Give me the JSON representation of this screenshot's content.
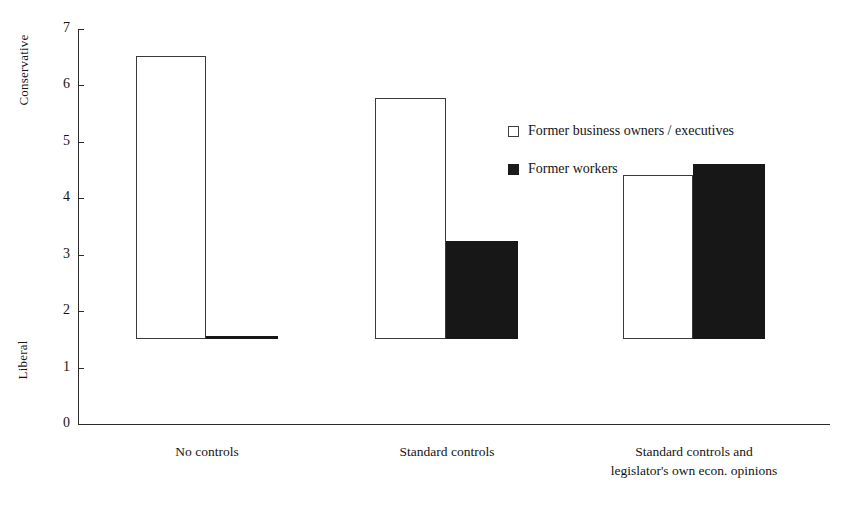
{
  "chart_data": {
    "type": "bar",
    "title": "",
    "xlabel": "",
    "ylabel": "",
    "ylim": [
      0,
      7
    ],
    "grid": false,
    "legend_position": "inside-top-right",
    "y_axis_top_label": "Conservative",
    "y_axis_bottom_label": "Liberal",
    "y_ticks": [
      "7",
      "6",
      "5",
      "4",
      "3",
      "2",
      "1",
      "0"
    ],
    "categories": [
      "No controls",
      "Standard controls",
      "Standard controls and\nlegislator's own econ. opinions"
    ],
    "category_lines": [
      [
        "No controls"
      ],
      [
        "Standard controls"
      ],
      [
        "Standard controls and",
        "legislator's own econ. opinions"
      ]
    ],
    "series": [
      {
        "name": "Former business owners / executives",
        "style": "open",
        "values": [
          5.02,
          4.28,
          2.9
        ]
      },
      {
        "name": "Former workers",
        "style": "filled",
        "values": [
          0.05,
          1.74,
          3.1
        ]
      }
    ]
  },
  "legend": {
    "items": [
      {
        "label": "Former business owners / executives",
        "swatch": "open-square-icon"
      },
      {
        "label": "Former workers",
        "swatch": "filled-square-icon"
      }
    ]
  },
  "colors": {
    "axis": "#2b2b2b",
    "text": "#141414",
    "bar_open_fill": "#ffffff",
    "bar_open_stroke": "#3a3a3a",
    "bar_filled": "#171717",
    "background": "#ffffff"
  }
}
